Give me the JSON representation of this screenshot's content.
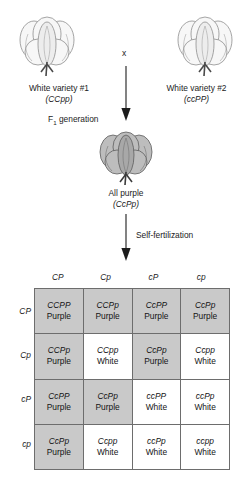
{
  "diagram": {
    "cross_symbol": "x",
    "parents": [
      {
        "icon": "cotton-boll-white-icon",
        "label": "White variety #1",
        "genotype": "(CCpp)"
      },
      {
        "icon": "cotton-boll-white-icon",
        "label": "White variety #2",
        "genotype": "(ccPP)"
      }
    ],
    "f1": {
      "stage_label": "F",
      "stage_subscript": "1",
      "stage_label_tail": " generation",
      "icon": "cotton-boll-purple-icon",
      "phenotype": "All purple",
      "genotype": "(CcPp)"
    },
    "self_fertilization_label": "Self-fertilization"
  },
  "punnett": {
    "column_headers": [
      "CP",
      "Cp",
      "cP",
      "cp"
    ],
    "row_headers": [
      "CP",
      "Cp",
      "cP",
      "cp"
    ],
    "colors": {
      "purple_cell": "#c9c9c9",
      "white_cell": "#ffffff",
      "border": "#6d6d6d"
    },
    "rows": [
      [
        {
          "genotype": "CCPP",
          "phenotype": "Purple",
          "shade": "purple"
        },
        {
          "genotype": "CCPp",
          "phenotype": "Purple",
          "shade": "purple"
        },
        {
          "genotype": "CcPP",
          "phenotype": "Purple",
          "shade": "purple"
        },
        {
          "genotype": "CcPp",
          "phenotype": "Purple",
          "shade": "purple"
        }
      ],
      [
        {
          "genotype": "CCPp",
          "phenotype": "Purple",
          "shade": "purple"
        },
        {
          "genotype": "CCpp",
          "phenotype": "White",
          "shade": "white"
        },
        {
          "genotype": "CcPp",
          "phenotype": "Purple",
          "shade": "purple"
        },
        {
          "genotype": "Ccpp",
          "phenotype": "White",
          "shade": "white"
        }
      ],
      [
        {
          "genotype": "CcPP",
          "phenotype": "Purple",
          "shade": "purple"
        },
        {
          "genotype": "CcPp",
          "phenotype": "Purple",
          "shade": "purple"
        },
        {
          "genotype": "ccPP",
          "phenotype": "White",
          "shade": "white"
        },
        {
          "genotype": "ccPp",
          "phenotype": "White",
          "shade": "white"
        }
      ],
      [
        {
          "genotype": "CcPp",
          "phenotype": "Purple",
          "shade": "purple"
        },
        {
          "genotype": "Ccpp",
          "phenotype": "White",
          "shade": "white"
        },
        {
          "genotype": "ccPp",
          "phenotype": "White",
          "shade": "white"
        },
        {
          "genotype": "ccpp",
          "phenotype": "White",
          "shade": "white"
        }
      ]
    ]
  }
}
